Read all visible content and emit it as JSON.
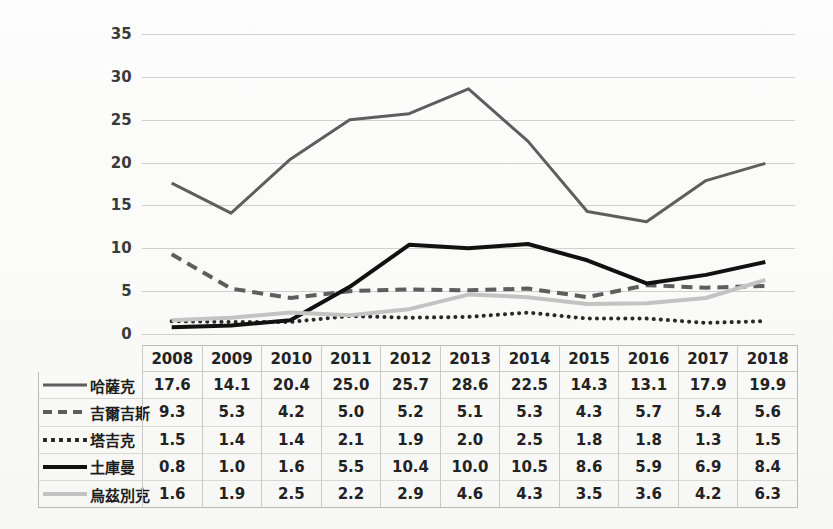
{
  "chart_data": {
    "type": "line",
    "title": "",
    "xlabel": "",
    "ylabel": "",
    "categories": [
      "2008",
      "2009",
      "2010",
      "2011",
      "2012",
      "2013",
      "2014",
      "2015",
      "2016",
      "2017",
      "2018"
    ],
    "ylim": [
      0,
      35
    ],
    "ytick_step": 5,
    "yticks": [
      "35",
      "30",
      "25",
      "20",
      "15",
      "10",
      "5",
      "0"
    ],
    "grid": true,
    "legend_position": "bottom-left-table",
    "series": [
      {
        "name": "哈薩克",
        "style": "solid",
        "color": "#5e5e5e",
        "width": 3,
        "values": [
          17.6,
          14.1,
          20.4,
          25.0,
          25.7,
          28.6,
          22.5,
          14.3,
          13.1,
          17.9,
          19.9
        ]
      },
      {
        "name": "吉爾吉斯",
        "style": "dashed",
        "color": "#5e5e5e",
        "width": 4,
        "values": [
          9.3,
          5.3,
          4.2,
          5.0,
          5.2,
          5.1,
          5.3,
          4.3,
          5.7,
          5.4,
          5.6
        ]
      },
      {
        "name": "塔吉克",
        "style": "dotted",
        "color": "#2a2a2a",
        "width": 4,
        "values": [
          1.5,
          1.4,
          1.4,
          2.1,
          1.9,
          2.0,
          2.5,
          1.8,
          1.8,
          1.3,
          1.5
        ]
      },
      {
        "name": "土庫曼",
        "style": "solid",
        "color": "#111111",
        "width": 4,
        "values": [
          0.8,
          1.0,
          1.6,
          5.5,
          10.4,
          10.0,
          10.5,
          8.6,
          5.9,
          6.9,
          8.4
        ]
      },
      {
        "name": "烏茲別克",
        "style": "solid",
        "color": "#c3c3c3",
        "width": 4,
        "values": [
          1.6,
          1.9,
          2.5,
          2.2,
          2.9,
          4.6,
          4.3,
          3.5,
          3.6,
          4.2,
          6.3
        ]
      }
    ]
  },
  "table": {
    "header_blank": "",
    "columns": [
      "2008",
      "2009",
      "2010",
      "2011",
      "2012",
      "2013",
      "2014",
      "2015",
      "2016",
      "2017",
      "2018"
    ],
    "rows": [
      {
        "label": "哈薩克",
        "swatch": "solid-gray-line-icon",
        "values": [
          "17.6",
          "14.1",
          "20.4",
          "25.0",
          "25.7",
          "28.6",
          "22.5",
          "14.3",
          "13.1",
          "17.9",
          "19.9"
        ]
      },
      {
        "label": "吉爾吉斯",
        "swatch": "dashed-gray-line-icon",
        "values": [
          "9.3",
          "5.3",
          "4.2",
          "5.0",
          "5.2",
          "5.1",
          "5.3",
          "4.3",
          "5.7",
          "5.4",
          "5.6"
        ]
      },
      {
        "label": "塔吉克",
        "swatch": "dotted-dark-line-icon",
        "values": [
          "1.5",
          "1.4",
          "1.4",
          "2.1",
          "1.9",
          "2.0",
          "2.5",
          "1.8",
          "1.8",
          "1.3",
          "1.5"
        ]
      },
      {
        "label": "土庫曼",
        "swatch": "solid-black-line-icon",
        "values": [
          "0.8",
          "1.0",
          "1.6",
          "5.5",
          "10.4",
          "10.0",
          "10.5",
          "8.6",
          "5.9",
          "6.9",
          "8.4"
        ]
      },
      {
        "label": "烏茲別克",
        "swatch": "solid-light-line-icon",
        "values": [
          "1.6",
          "1.9",
          "2.5",
          "2.2",
          "2.9",
          "4.6",
          "4.3",
          "3.5",
          "3.6",
          "4.2",
          "6.3"
        ]
      }
    ]
  }
}
